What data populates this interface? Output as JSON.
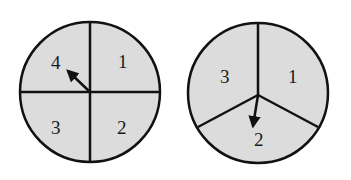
{
  "spinners": [
    {
      "name": "four-section-spinner",
      "sections": [
        "1",
        "2",
        "3",
        "4"
      ],
      "labels": {
        "top_right": "1",
        "bottom_right": "2",
        "bottom_left": "3",
        "top_left": "4"
      },
      "arrow_points_to": "4"
    },
    {
      "name": "three-section-spinner",
      "sections": [
        "1",
        "2",
        "3"
      ],
      "labels": {
        "right": "1",
        "bottom": "2",
        "left": "3"
      },
      "arrow_points_to": "2"
    }
  ],
  "colors": {
    "fill": "#dcdcdc",
    "stroke": "#111111"
  }
}
